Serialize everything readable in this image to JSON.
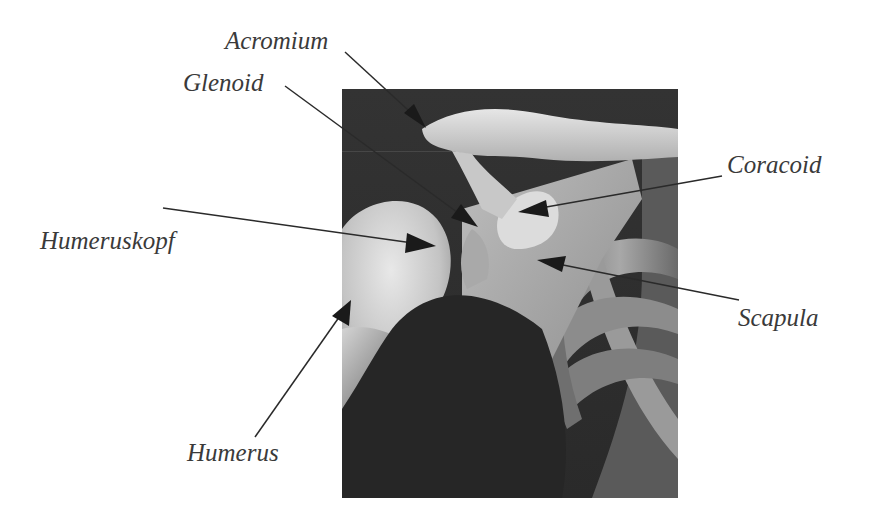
{
  "diagram": {
    "type": "anatomical-labeled-image",
    "labels": [
      {
        "id": "acromium",
        "text": "Acromium",
        "x": 225,
        "y": 28,
        "line": [
          345,
          52,
          425,
          128
        ]
      },
      {
        "id": "glenoid",
        "text": "Glenoid",
        "x": 183,
        "y": 70,
        "line": [
          285,
          86,
          478,
          227
        ]
      },
      {
        "id": "coracoid",
        "text": "Coracoid",
        "x": 727,
        "y": 152,
        "line": [
          722,
          176,
          518,
          212
        ]
      },
      {
        "id": "humeruskopf",
        "text": "Humeruskopf",
        "x": 40,
        "y": 228,
        "line": [
          163,
          208,
          436,
          246
        ]
      },
      {
        "id": "scapula",
        "text": "Scapula",
        "x": 738,
        "y": 305,
        "line": [
          739,
          300,
          537,
          260
        ]
      },
      {
        "id": "humerus",
        "text": "Humerus",
        "x": 187,
        "y": 440,
        "line": [
          255,
          437,
          351,
          300
        ]
      }
    ],
    "colors": {
      "text": "#3a3a3a",
      "line": "#2a2a2a",
      "arrow": "#1a1a1a",
      "image_bg": "#2e2e2e"
    }
  }
}
